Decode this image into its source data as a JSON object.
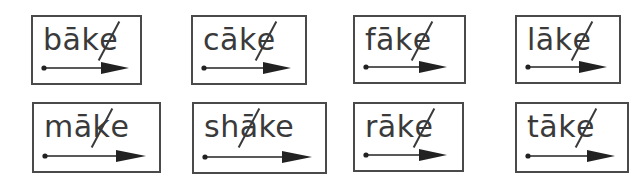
{
  "worksheet": {
    "title": "long a with silent e word cards",
    "cards": [
      {
        "word_pre": "bāk",
        "slash_char": "e",
        "word_post": "",
        "marked": "silent-e",
        "row": 1,
        "col": 1
      },
      {
        "word_pre": "cāk",
        "slash_char": "e",
        "word_post": "",
        "marked": "silent-e",
        "row": 1,
        "col": 2
      },
      {
        "word_pre": "fāk",
        "slash_char": "e",
        "word_post": "",
        "marked": "silent-e",
        "row": 1,
        "col": 3
      },
      {
        "word_pre": "lāk",
        "slash_char": "e",
        "word_post": "",
        "marked": "silent-e",
        "row": 1,
        "col": 4
      },
      {
        "word_pre": "mā",
        "slash_char": "k",
        "word_post": "e",
        "marked": "slash-k",
        "row": 2,
        "col": 1
      },
      {
        "word_pre": "sh",
        "slash_char": "ā",
        "word_post": "ke",
        "marked": "slash-a",
        "row": 2,
        "col": 2
      },
      {
        "word_pre": "rāk",
        "slash_char": "e",
        "word_post": "",
        "marked": "silent-e",
        "row": 2,
        "col": 3
      },
      {
        "word_pre": "tāk",
        "slash_char": "e",
        "word_post": "",
        "marked": "silent-e",
        "row": 2,
        "col": 4
      }
    ],
    "arrow_icon": "right-arrow-with-dot",
    "colors": {
      "border": "#4a4a4a",
      "text": "#3a3a3a",
      "arrow": "#222222"
    }
  }
}
